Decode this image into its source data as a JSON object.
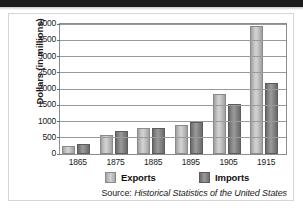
{
  "figure": {
    "source_prefix": "Source:",
    "source_title": "Historical Statistics of the United States"
  },
  "chart_data": {
    "type": "bar",
    "title": "",
    "subtitle": "",
    "xlabel": "",
    "ylabel": "Dollars (in millions)",
    "categories": [
      "1865",
      "1875",
      "1885",
      "1895",
      "1905",
      "1915"
    ],
    "series": [
      {
        "name": "Exports",
        "color": "#c8c8c8",
        "values": [
          250,
          600,
          800,
          880,
          1850,
          3950
        ]
      },
      {
        "name": "Imports",
        "color": "#7a7a7a",
        "values": [
          300,
          700,
          790,
          1000,
          1550,
          2200
        ]
      }
    ],
    "ylim": [
      0,
      4000
    ],
    "yticks": [
      0,
      500,
      1000,
      1500,
      2000,
      2500,
      3000,
      3500,
      4000
    ],
    "ytick_labels": [
      "0",
      "500",
      "1000",
      "1500",
      "2000",
      "2500",
      "3000",
      "3500",
      "4000"
    ],
    "grid": true,
    "legend_position": "bottom",
    "legend": [
      "Exports",
      "Imports"
    ]
  }
}
